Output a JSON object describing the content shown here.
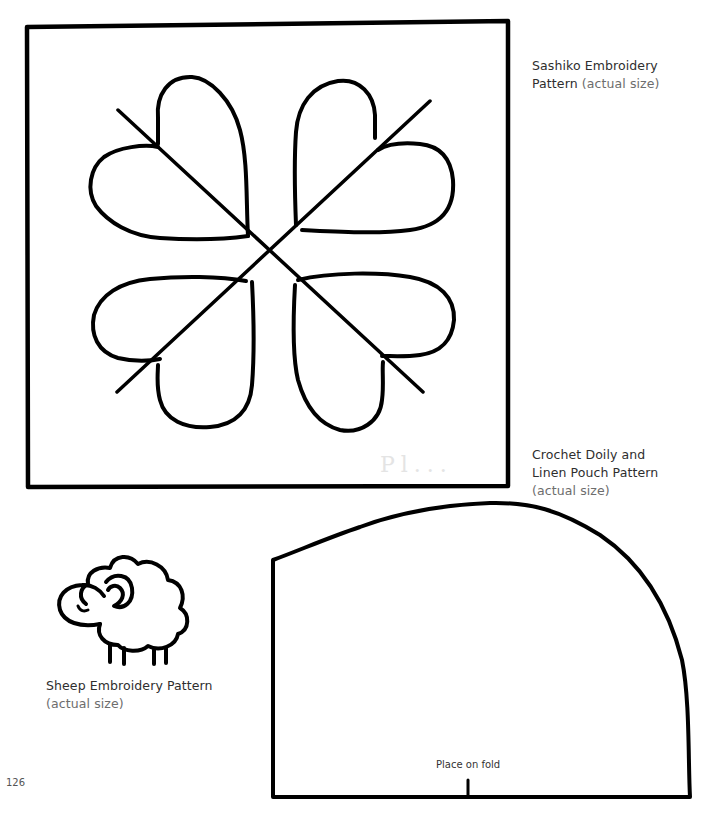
{
  "page": {
    "page_number": "126",
    "background_color": "#ffffff",
    "ink_color": "#000000"
  },
  "patterns": {
    "sashiko": {
      "title": "Sashiko Embroidery",
      "title_line2": "Pattern",
      "note": "(actual size)",
      "shape": "square-frame-with-four-heart-leaf-motif",
      "faint_mark": "Pl..."
    },
    "pouch": {
      "title_line1": "Crochet Doily and",
      "title_line2": "Linen Pouch Pattern",
      "note": "(actual size)",
      "fold_label": "Place on fold",
      "shape": "half-dome-pattern-piece"
    },
    "sheep": {
      "title": "Sheep Embroidery Pattern",
      "note": "(actual size)",
      "shape": "sheep-outline-icon"
    }
  }
}
